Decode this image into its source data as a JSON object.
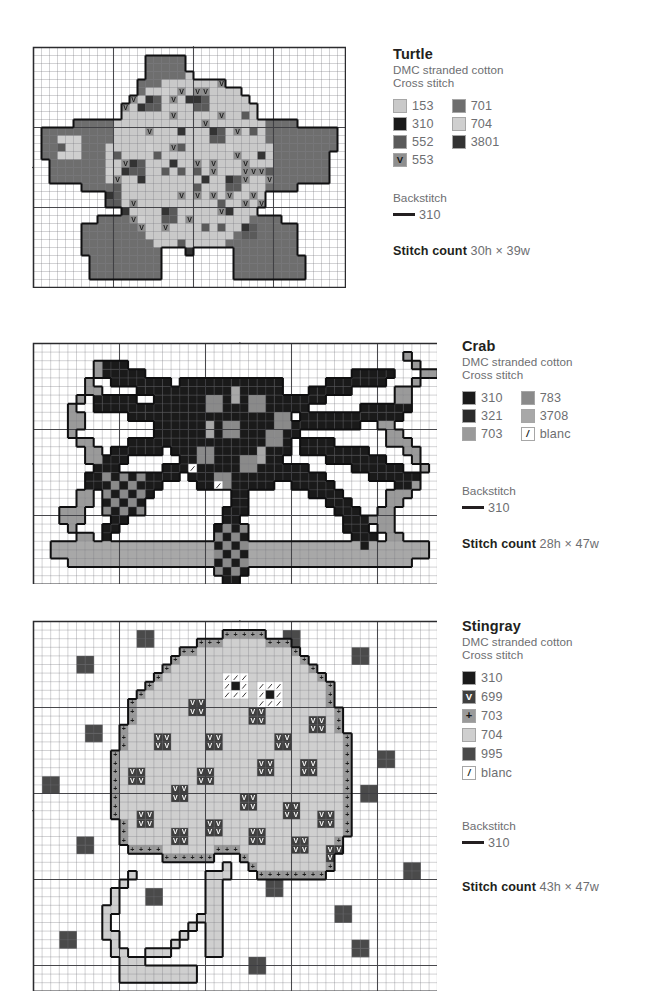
{
  "page": {
    "background": "#ffffff",
    "text_color": "#6d6e71",
    "heading_color": "#231f20"
  },
  "palette": {
    "153": "#c9c9c9",
    "310": "#1a1a1a",
    "321": "#2b2b2b",
    "552": "#5a5a5a",
    "553": "#8e8e8e",
    "699": "#3f3f3f",
    "701": "#6e6e6e",
    "703": "#9a9a9a",
    "704": "#cfcfcf",
    "783": "#8a8a8a",
    "995": "#4a4a4a",
    "3708": "#a8a8a8",
    "3801": "#333333",
    "blanc": "#ffffff"
  },
  "patterns": [
    {
      "id": "turtle",
      "legend": {
        "title": "Turtle",
        "sub1": "DMC stranded cotton",
        "sub2": "Cross stitch",
        "columns": [
          [
            {
              "code": "153",
              "color": "#c9c9c9",
              "symbol": ""
            },
            {
              "code": "310",
              "color": "#1a1a1a",
              "symbol": ""
            },
            {
              "code": "552",
              "color": "#5a5a5a",
              "symbol": ""
            },
            {
              "code": "553",
              "color": "#8e8e8e",
              "symbol": "V"
            }
          ],
          [
            {
              "code": "701",
              "color": "#6e6e6e",
              "symbol": ""
            },
            {
              "code": "704",
              "color": "#cfcfcf",
              "symbol": ""
            },
            {
              "code": "3801",
              "color": "#333333",
              "symbol": ""
            }
          ]
        ],
        "backstitch_head": "Backstitch",
        "backstitch_code": "310",
        "count_label": "Stitch count",
        "count_value": "30h × 39w"
      },
      "chart": {
        "cols": 39,
        "rows": 30,
        "cell": 8,
        "major_every": 10,
        "center_marks": {
          "top": 20,
          "bottom": 20,
          "left": 15,
          "right": 15
        }
      }
    },
    {
      "id": "crab",
      "legend": {
        "title": "Crab",
        "sub1": "DMC stranded cotton",
        "sub2": "Cross stitch",
        "columns": [
          [
            {
              "code": "310",
              "color": "#1a1a1a",
              "symbol": ""
            },
            {
              "code": "321",
              "color": "#2b2b2b",
              "symbol": ""
            },
            {
              "code": "703",
              "color": "#9a9a9a",
              "symbol": ""
            }
          ],
          [
            {
              "code": "783",
              "color": "#8a8a8a",
              "symbol": ""
            },
            {
              "code": "3708",
              "color": "#a8a8a8",
              "symbol": ""
            },
            {
              "code": "blanc",
              "color": "#ffffff",
              "symbol": "/"
            }
          ]
        ],
        "backstitch_head": "Backstitch",
        "backstitch_code": "310",
        "count_label": "Stitch count",
        "count_value": "28h × 47w"
      },
      "chart": {
        "cols": 47,
        "rows": 28,
        "cell": 8.6,
        "major_every": 10,
        "center_marks": {
          "top": 24,
          "bottom": 24,
          "left": 14,
          "right": 14
        }
      }
    },
    {
      "id": "stingray",
      "legend": {
        "title": "Stingray",
        "sub1": "DMC stranded cotton",
        "sub2": "Cross stitch",
        "columns": [
          [
            {
              "code": "310",
              "color": "#1a1a1a",
              "symbol": ""
            },
            {
              "code": "699",
              "color": "#3f3f3f",
              "symbol": "V"
            },
            {
              "code": "703",
              "color": "#9a9a9a",
              "symbol": "+"
            },
            {
              "code": "704",
              "color": "#cfcfcf",
              "symbol": ""
            },
            {
              "code": "995",
              "color": "#4a4a4a",
              "symbol": ""
            },
            {
              "code": "blanc",
              "color": "#ffffff",
              "symbol": "/"
            }
          ]
        ],
        "backstitch_head": "Backstitch",
        "backstitch_code": "310",
        "count_label": "Stitch count",
        "count_value": "43h × 47w"
      },
      "chart": {
        "cols": 47,
        "rows": 43,
        "cell": 8.6,
        "major_every": 10,
        "center_marks": {
          "top": 24,
          "bottom": 24,
          "left": 22,
          "right": 22
        }
      }
    }
  ],
  "chart_data": {
    "type": "heatmap",
    "note": "Each chart is a stitch grid; cells are colour-coded by DMC thread code, with major gridlines every 10 stitches and centre arrows on each edge.",
    "charts": [
      {
        "id": "turtle",
        "grid": {
          "w": 39,
          "h": 30
        },
        "legend_codes": [
          "153",
          "310",
          "552",
          "553",
          "701",
          "704",
          "3801"
        ],
        "backstitch": "310",
        "stitch_count": {
          "h": 30,
          "w": 39
        },
        "shell": {
          "base_codes": [
            "153",
            "704"
          ],
          "symbol_code": "553",
          "symbol": "V",
          "accent_codes": [
            "552",
            "3801",
            "310"
          ],
          "bounds": {
            "x0": 10,
            "y0": 4,
            "x1": 30,
            "y1": 26
          }
        },
        "flippers": {
          "code": "701",
          "outline": "310",
          "regions": [
            {
              "name": "head-top",
              "x0": 13,
              "y0": 1,
              "x1": 19,
              "y1": 7
            },
            {
              "name": "front-left",
              "x0": 2,
              "y0": 9,
              "x1": 10,
              "y1": 17
            },
            {
              "name": "front-right",
              "x0": 30,
              "y0": 9,
              "x1": 38,
              "y1": 17
            },
            {
              "name": "rear-left",
              "x0": 6,
              "y0": 21,
              "x1": 15,
              "y1": 29
            },
            {
              "name": "rear-right",
              "x0": 24,
              "y0": 21,
              "x1": 34,
              "y1": 29
            }
          ]
        }
      },
      {
        "id": "crab",
        "grid": {
          "w": 47,
          "h": 28
        },
        "legend_codes": [
          "310",
          "321",
          "703",
          "783",
          "3708",
          "blanc"
        ],
        "backstitch": "310",
        "stitch_count": {
          "h": 28,
          "w": 47
        },
        "body": {
          "dark_codes": [
            "310",
            "321"
          ],
          "highlight_codes": [
            "783",
            "3708"
          ],
          "blanc_cells": [
            [
              18,
              14
            ],
            [
              21,
              16
            ]
          ],
          "bounds": {
            "x0": 7,
            "y0": 1,
            "x1": 40,
            "y1": 27
          }
        },
        "seabed": {
          "code": "3708",
          "rows": [
            23,
            24
          ],
          "x0": 3,
          "x1": 45
        },
        "seaweed": {
          "code": "703",
          "left_x": [
            4,
            7
          ],
          "right_x": [
            39,
            44
          ]
        }
      },
      {
        "id": "stingray",
        "grid": {
          "w": 47,
          "h": 43
        },
        "legend_codes": [
          "310",
          "699",
          "703",
          "704",
          "995",
          "blanc"
        ],
        "backstitch": "310",
        "stitch_count": {
          "h": 43,
          "w": 47
        },
        "body": {
          "fill_code": "704",
          "edge_symbol_code": "703",
          "edge_symbol": "+",
          "spot_symbol_code": "699",
          "spot_symbol": "V",
          "spot_block": "2x2",
          "spot_count": 22,
          "bounds": {
            "x0": 8,
            "y0": 1,
            "x1": 38,
            "y1": 31
          }
        },
        "tail": {
          "outline": "310",
          "fill_code": "704",
          "bounds": {
            "x0": 8,
            "y0": 28,
            "x1": 24,
            "y1": 42
          }
        },
        "eyes": [
          {
            "cx": 23,
            "cy": 7,
            "pupil_code": "310",
            "ring_code": "blanc"
          },
          {
            "cx": 27,
            "cy": 8,
            "pupil_code": "310",
            "ring_code": "blanc"
          }
        ],
        "bubbles": {
          "code": "995",
          "block": "2x2",
          "count": 18
        }
      }
    ]
  }
}
